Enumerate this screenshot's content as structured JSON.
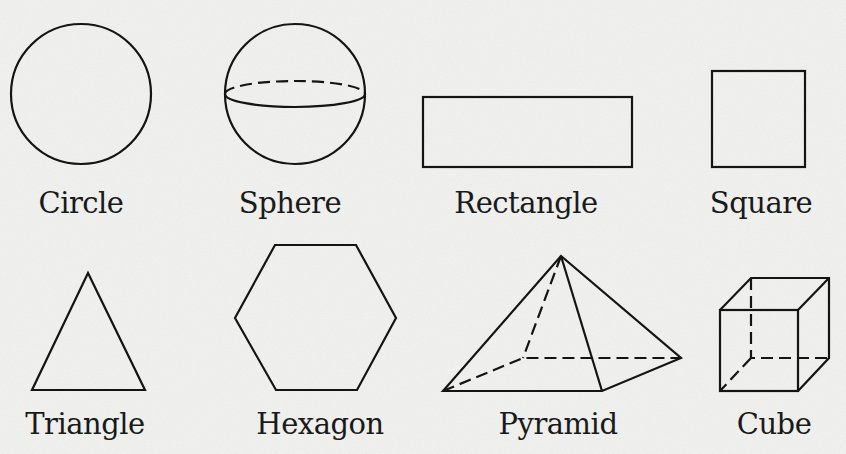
{
  "diagram": {
    "shapes": [
      {
        "id": "circle",
        "label": "Circle",
        "type": "2D"
      },
      {
        "id": "sphere",
        "label": "Sphere",
        "type": "3D"
      },
      {
        "id": "rectangle",
        "label": "Rectangle",
        "type": "2D"
      },
      {
        "id": "square",
        "label": "Square",
        "type": "2D"
      },
      {
        "id": "triangle",
        "label": "Triangle",
        "type": "2D"
      },
      {
        "id": "hexagon",
        "label": "Hexagon",
        "type": "2D"
      },
      {
        "id": "pyramid",
        "label": "Pyramid",
        "type": "3D"
      },
      {
        "id": "cube",
        "label": "Cube",
        "type": "3D"
      }
    ]
  },
  "colors": {
    "background": "#f2f2f0",
    "stroke": "#141414"
  }
}
